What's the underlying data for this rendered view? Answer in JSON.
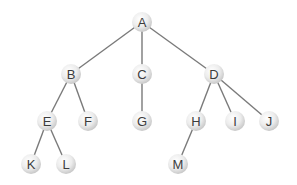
{
  "diagram": {
    "type": "tree",
    "colors": {
      "edge": "#7a7a7a",
      "node_light": "#ffffff",
      "node_dark": "#cfcfcf",
      "label": "#3c3c3c"
    },
    "node_radius": 10,
    "nodes": [
      {
        "id": "A",
        "label": "A",
        "x": 142,
        "y": 22
      },
      {
        "id": "B",
        "label": "B",
        "x": 71,
        "y": 74
      },
      {
        "id": "C",
        "label": "C",
        "x": 142,
        "y": 74
      },
      {
        "id": "D",
        "label": "D",
        "x": 214,
        "y": 74
      },
      {
        "id": "E",
        "label": "E",
        "x": 47,
        "y": 121
      },
      {
        "id": "F",
        "label": "F",
        "x": 88,
        "y": 121
      },
      {
        "id": "G",
        "label": "G",
        "x": 142,
        "y": 121
      },
      {
        "id": "H",
        "label": "H",
        "x": 196,
        "y": 121
      },
      {
        "id": "I",
        "label": "I",
        "x": 235,
        "y": 121
      },
      {
        "id": "J",
        "label": "J",
        "x": 269,
        "y": 121
      },
      {
        "id": "K",
        "label": "K",
        "x": 31,
        "y": 164
      },
      {
        "id": "L",
        "label": "L",
        "x": 66,
        "y": 164
      },
      {
        "id": "M",
        "label": "M",
        "x": 178,
        "y": 164
      }
    ],
    "edges": [
      [
        "A",
        "B"
      ],
      [
        "A",
        "C"
      ],
      [
        "A",
        "D"
      ],
      [
        "B",
        "E"
      ],
      [
        "B",
        "F"
      ],
      [
        "C",
        "G"
      ],
      [
        "D",
        "H"
      ],
      [
        "D",
        "I"
      ],
      [
        "D",
        "J"
      ],
      [
        "E",
        "K"
      ],
      [
        "E",
        "L"
      ],
      [
        "H",
        "M"
      ]
    ]
  }
}
